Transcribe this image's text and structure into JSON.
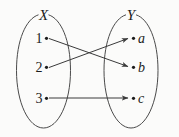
{
  "figure": {
    "background_color": "#fbfbfa",
    "stroke_color": "#3a3a3a",
    "outline_color": "#4a4a4a"
  },
  "domain_set": {
    "name": "X",
    "label": "X",
    "elements": [
      {
        "id": "1",
        "label": "1",
        "cx": 46.5,
        "cy": 38
      },
      {
        "id": "2",
        "label": "2",
        "cx": 46.5,
        "cy": 67
      },
      {
        "id": "3",
        "label": "3",
        "cx": 46.5,
        "cy": 98
      }
    ]
  },
  "codomain_set": {
    "name": "Y",
    "label": "Y",
    "elements": [
      {
        "id": "a",
        "label": "a",
        "cx": 133.5,
        "cy": 38
      },
      {
        "id": "b",
        "label": "b",
        "cx": 133.5,
        "cy": 67
      },
      {
        "id": "c",
        "label": "c",
        "cx": 133.5,
        "cy": 98
      }
    ]
  },
  "mappings": [
    {
      "id": "map-1-b",
      "from": "1",
      "to": "b",
      "x1": 49,
      "y1": 38.5,
      "x2": 128,
      "y2": 66.5
    },
    {
      "id": "map-2-a",
      "from": "2",
      "to": "a",
      "x1": 49,
      "y1": 67.5,
      "x2": 128,
      "y2": 38.5
    },
    {
      "id": "map-3-c",
      "from": "3",
      "to": "c",
      "x1": 49,
      "y1": 98,
      "x2": 128,
      "y2": 98
    }
  ]
}
